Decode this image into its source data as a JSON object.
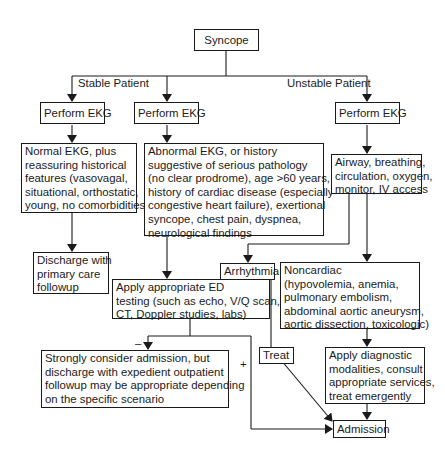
{
  "diagram": {
    "root": "Syncope",
    "branch_labels": {
      "stable": "Stable Patient",
      "unstable": "Unstable Patient"
    },
    "nodes": {
      "perform_ekg_1": "Perform EKG",
      "perform_ekg_2": "Perform EKG",
      "perform_ekg_3": "Perform EKG",
      "normal_ekg": [
        "Normal EKG, plus",
        "reassuring historical",
        "features (vasovagal,",
        "situational, orthostatic,",
        "young, no comorbidities)"
      ],
      "abnormal_ekg": [
        "Abnormal EKG, or history",
        "suggestive of serious pathology",
        "(no clear prodrome), age >60 years,",
        "history of cardiac disease (especially",
        "congestive heart failure), exertional",
        "syncope, chest pain, dyspnea,",
        "neurological findings"
      ],
      "airway": [
        "Airway, breathing,",
        "circulation, oxygen,",
        "monitor, IV access"
      ],
      "discharge": [
        "Discharge with",
        "primary care",
        "followup"
      ],
      "ed_testing": [
        "Apply appropriate ED",
        "testing (such as echo, V/Q scan,",
        "CT, Doppler studies, labs)"
      ],
      "arrhythmia": "Arrhythmia",
      "noncardiac": [
        "Noncardiac",
        "(hypovolemia, anemia,",
        "pulmonary embolism,",
        "abdominal aortic aneurysm,",
        "aortic dissection, toxicologic)"
      ],
      "consider_admission": [
        "Strongly consider admission, but",
        "discharge with expedient outpatient",
        "followup may be appropriate depending",
        "on the specific scenario"
      ],
      "treat": "Treat",
      "diagnostic": [
        "Apply diagnostic",
        "modalities, consult",
        "appropriate services,",
        "treat emergently"
      ],
      "admission": "Admission"
    },
    "edge_labels": {
      "negative": "–",
      "positive": "+"
    },
    "colors": {
      "line": "#1a1a1a",
      "background": "#ffffff"
    }
  }
}
